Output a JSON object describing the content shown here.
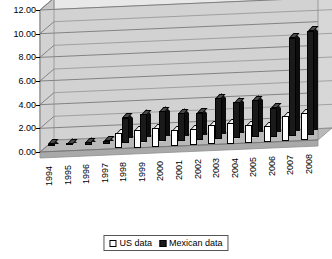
{
  "chart_data": {
    "type": "bar",
    "title": "",
    "xlabel": "",
    "ylabel": "",
    "ylim": [
      0,
      12
    ],
    "ytick_step": 2,
    "grid": true,
    "legend_position": "bottom-center",
    "three_d": true,
    "ytick_labels": [
      "12.00",
      "10.00",
      "8.00",
      "6.00",
      "4.00",
      "2.00",
      "0.00"
    ],
    "categories": [
      "1994",
      "1995",
      "1996",
      "1997",
      "1998",
      "1999",
      "2000",
      "2001",
      "2002",
      "2003",
      "2004",
      "2005",
      "2006",
      "2007",
      "2008"
    ],
    "series": [
      {
        "name": "US data",
        "color": "#ffffff",
        "values": [
          0.0,
          0.0,
          0.0,
          0.0,
          1.3,
          1.45,
          1.55,
          1.35,
          1.35,
          1.6,
          1.7,
          1.5,
          1.35,
          2.1,
          2.3
        ]
      },
      {
        "name": "Mexican data",
        "color": "#1a1a1a",
        "values": [
          0.2,
          0.2,
          0.2,
          0.25,
          2.15,
          2.35,
          2.55,
          2.3,
          2.3,
          3.45,
          3.05,
          3.15,
          2.45,
          8.3,
          8.8
        ]
      }
    ]
  },
  "legend": {
    "items": [
      {
        "label": "US data",
        "swatch": "hollow-square-icon"
      },
      {
        "label": "Mexican data",
        "swatch": "filled-square-icon"
      }
    ]
  }
}
